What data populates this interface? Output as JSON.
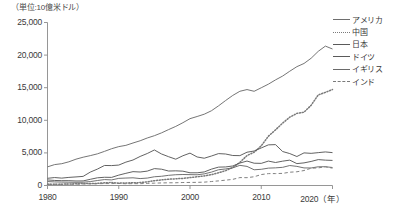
{
  "chart_data": {
    "type": "line",
    "title": "",
    "subtitle": "",
    "unit_label": "（単位:10億米ドル）",
    "xlabel": "（年）",
    "ylabel": "",
    "xlim": [
      1980,
      2020
    ],
    "ylim": [
      0,
      25000
    ],
    "grid": false,
    "legend_position": "right",
    "x_ticks": [
      "1980",
      "1990",
      "2000",
      "2010",
      "2020"
    ],
    "x_tick_values": [
      1980,
      1990,
      2000,
      2010,
      2020
    ],
    "y_ticks": [
      "0",
      "5,000",
      "10,000",
      "15,000",
      "20,000",
      "25,000"
    ],
    "y_tick_values": [
      0,
      5000,
      10000,
      15000,
      20000,
      25000
    ],
    "x": [
      1980,
      1981,
      1982,
      1983,
      1984,
      1985,
      1986,
      1987,
      1988,
      1989,
      1990,
      1991,
      1992,
      1993,
      1994,
      1995,
      1996,
      1997,
      1998,
      1999,
      2000,
      2001,
      2002,
      2003,
      2004,
      2005,
      2006,
      2007,
      2008,
      2009,
      2010,
      2011,
      2012,
      2013,
      2014,
      2015,
      2016,
      2017,
      2018,
      2019,
      2020
    ],
    "series": [
      {
        "name": "アメリカ",
        "style": "solid",
        "color": "#6e6e6e",
        "values": [
          2857,
          3207,
          3344,
          3634,
          4038,
          4339,
          4580,
          4855,
          5236,
          5642,
          5963,
          6158,
          6520,
          6859,
          7287,
          7640,
          8073,
          8578,
          9063,
          9631,
          10251,
          10582,
          10936,
          11458,
          12214,
          13037,
          13815,
          14452,
          14713,
          14449,
          14992,
          15543,
          16197,
          16785,
          17527,
          18225,
          18715,
          19519,
          20580,
          21380,
          20937
        ]
      },
      {
        "name": "中国",
        "style": "dotted",
        "color": "#7a7a7a",
        "values": [
          191,
          195,
          205,
          230,
          259,
          309,
          300,
          327,
          410,
          459,
          361,
          383,
          427,
          445,
          564,
          734,
          863,
          962,
          1029,
          1094,
          1211,
          1339,
          1471,
          1660,
          1955,
          2286,
          2752,
          3550,
          4594,
          5102,
          6087,
          7551,
          8532,
          9570,
          10476,
          11062,
          11233,
          12310,
          13895,
          14280,
          14723
        ]
      },
      {
        "name": "日本",
        "style": "solid",
        "color": "#5a5a5a",
        "values": [
          1105,
          1219,
          1134,
          1243,
          1318,
          1399,
          2054,
          2516,
          3072,
          3055,
          3133,
          3585,
          3909,
          4455,
          4907,
          5449,
          4834,
          4415,
          4033,
          4562,
          4968,
          4375,
          4182,
          4519,
          4893,
          4831,
          4601,
          4580,
          5106,
          5289,
          5759,
          6233,
          6272,
          5212,
          4897,
          4444,
          5003,
          4931,
          5041,
          5149,
          5040
        ]
      },
      {
        "name": "ドイツ",
        "style": "solid",
        "color": "#5a5a5a",
        "values": [
          853,
          775,
          740,
          743,
          694,
          704,
          948,
          1181,
          1261,
          1246,
          1593,
          1868,
          2124,
          2070,
          2205,
          2591,
          2501,
          2218,
          2249,
          2199,
          1949,
          1950,
          2079,
          2505,
          2816,
          2846,
          2995,
          3440,
          3752,
          3418,
          3396,
          3744,
          3528,
          3733,
          3890,
          3357,
          3469,
          3690,
          3975,
          3888,
          3846
        ]
      },
      {
        "name": "イギリス",
        "style": "solid",
        "color": "#6a6a6a",
        "values": [
          605,
          551,
          524,
          507,
          489,
          505,
          601,
          762,
          909,
          857,
          1093,
          1141,
          1180,
          1063,
          1138,
          1340,
          1416,
          1559,
          1653,
          1687,
          1665,
          1645,
          1786,
          2054,
          2416,
          2538,
          2708,
          3090,
          2929,
          2412,
          2485,
          2663,
          2707,
          2786,
          3065,
          2933,
          2695,
          2687,
          2871,
          2879,
          2760
        ]
      },
      {
        "name": "インド",
        "style": "dashed",
        "color": "#7a7a7a",
        "values": [
          189,
          196,
          201,
          219,
          212,
          233,
          250,
          279,
          297,
          296,
          321,
          270,
          288,
          279,
          327,
          360,
          392,
          416,
          421,
          459,
          468,
          485,
          515,
          608,
          709,
          820,
          940,
          1217,
          1199,
          1342,
          1676,
          1823,
          1828,
          1857,
          2039,
          2104,
          2295,
          2651,
          2702,
          2870,
          2660
        ]
      }
    ]
  },
  "legend": {
    "items": [
      {
        "label": "アメリカ",
        "style": "solid"
      },
      {
        "label": "中国",
        "style": "dotted"
      },
      {
        "label": "日本",
        "style": "solid"
      },
      {
        "label": "ドイツ",
        "style": "solid"
      },
      {
        "label": "イギリス",
        "style": "solid"
      },
      {
        "label": "インド",
        "style": "dashed"
      }
    ]
  }
}
